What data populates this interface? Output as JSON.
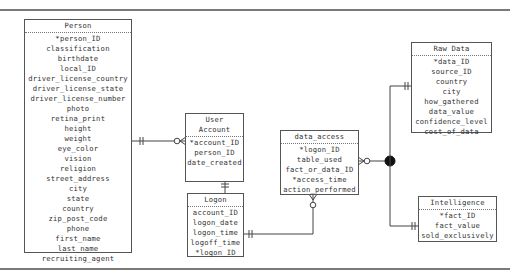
{
  "diagram": {
    "type": "entity-relationship",
    "entities": [
      {
        "id": "person",
        "name": "Person",
        "attributes": [
          "*person_ID",
          "classification",
          "birthdate",
          "local_ID",
          "driver_license_country",
          "driver_license_state",
          "driver_license_number",
          "photo",
          "retina_print",
          "height",
          "weight",
          "eye_color",
          "vision",
          "religion",
          "street_address",
          "city",
          "state",
          "country",
          "zip_post_code",
          "phone",
          "first_name",
          "last_name",
          "recruiting_agent"
        ]
      },
      {
        "id": "user_account",
        "name": "User Account",
        "attributes": [
          "*account_ID",
          "person_ID",
          "date_created"
        ]
      },
      {
        "id": "logon",
        "name": "Logon",
        "attributes": [
          "account_ID",
          "logon_date",
          "logon_time",
          "logoff_time",
          "*logon_ID"
        ]
      },
      {
        "id": "data_access",
        "name": "data_access",
        "attributes": [
          "*logon_ID",
          "table_used",
          "fact_or_data_ID",
          "*access_time",
          "action_performed"
        ]
      },
      {
        "id": "raw_data",
        "name": "Raw Data",
        "attributes": [
          "*data_ID",
          "source_ID",
          "country",
          "city",
          "how_gathered",
          "data_value",
          "confidence_level",
          "cost_of_data"
        ]
      },
      {
        "id": "intelligence",
        "name": "Intelligence",
        "attributes": [
          "*fact_ID",
          "fact_value",
          "sold_exclusively"
        ]
      }
    ],
    "relationships": [
      {
        "from": "Person",
        "from_end": "one-and-only-one",
        "to": "User Account",
        "to_end": "zero-or-many"
      },
      {
        "from": "User Account",
        "from_end": "one-and-only-one",
        "to": "Logon",
        "to_end": "zero-or-many"
      },
      {
        "from": "Logon",
        "from_end": "one-and-only-one",
        "to": "data_access",
        "to_end": "zero-or-many"
      },
      {
        "from": "data_access",
        "from_end": "zero-or-many",
        "to": "Raw Data / Intelligence",
        "to_end": "exclusive-subtype-junction"
      },
      {
        "from": "junction",
        "to": "Raw Data",
        "to_end": "one-and-only-one"
      },
      {
        "from": "junction",
        "to": "Intelligence",
        "to_end": "one-and-only-one"
      }
    ],
    "colors": {
      "line": "#444444",
      "border": "#555555",
      "text": "#333333",
      "rule": "#7a7a7a"
    }
  }
}
